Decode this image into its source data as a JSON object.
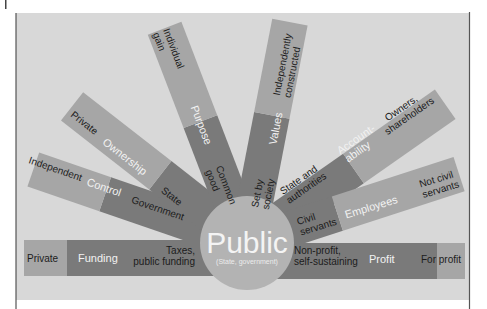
{
  "colors": {
    "page_bg": "#ffffff",
    "panel_bg": "#d8d8d8",
    "panel_border": "#555555",
    "ray_inner": "#7a7a7a",
    "ray_mid": "#9a9a9a",
    "ray_outer": "#aaaaaa",
    "circle": "#b3b3b3"
  },
  "center": {
    "title": "Public",
    "subtitle": "(State, government)"
  },
  "rays": [
    {
      "id": "funding",
      "category": "Funding",
      "public_label": [
        "Taxes,",
        "public funding"
      ],
      "private_label": [
        "Private"
      ]
    },
    {
      "id": "control",
      "category": "Control",
      "public_label": [
        "Government"
      ],
      "private_label": [
        "Independent"
      ]
    },
    {
      "id": "ownership",
      "category": "Ownership",
      "public_label": [
        "State"
      ],
      "private_label": [
        "Private"
      ]
    },
    {
      "id": "purpose",
      "category": "Purpose",
      "public_label": [
        "Common",
        "good"
      ],
      "private_label": [
        "Individual",
        "gain"
      ]
    },
    {
      "id": "values",
      "category": "Values",
      "public_label": [
        "Set by",
        "society"
      ],
      "private_label": [
        "Independently",
        "constructed"
      ]
    },
    {
      "id": "accountability",
      "category": [
        "Account-",
        "ability"
      ],
      "public_label": [
        "State and",
        "authorities"
      ],
      "private_label": [
        "Owners,",
        "shareholders"
      ]
    },
    {
      "id": "employees",
      "category": "Employees",
      "public_label": [
        "Civil",
        "servants"
      ],
      "private_label": [
        "Not civil",
        "servants"
      ]
    },
    {
      "id": "profit",
      "category": "Profit",
      "public_label": [
        "Non-profit,",
        "self-sustaining"
      ],
      "private_label": [
        "For profit"
      ]
    }
  ]
}
